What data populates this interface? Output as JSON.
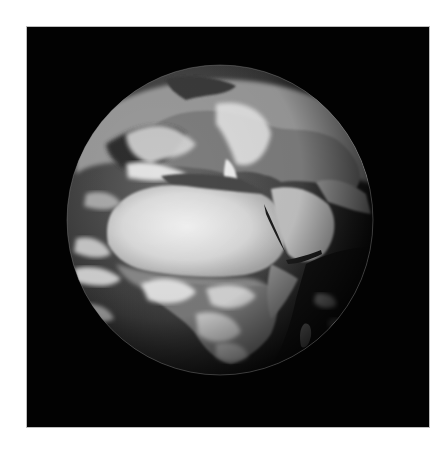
{
  "image": {
    "subject": "Earth from space",
    "description": "Grayscale satellite view of Earth centred on Africa, Europe and the Middle East",
    "palette": {
      "background": "#ffffff",
      "space": "#020202",
      "frame_border": "#bdbdbd",
      "ocean": "#3a3a3a",
      "land": "#8c8c8c",
      "desert": "#d9d9d9",
      "cloud": "#f2f2f2"
    },
    "visible_regions": [
      "Sahara",
      "Mediterranean Sea",
      "Europe",
      "Arabian Peninsula",
      "Red Sea",
      "Central Africa",
      "Southern Africa",
      "Atlantic Ocean",
      "Indian Ocean"
    ]
  }
}
